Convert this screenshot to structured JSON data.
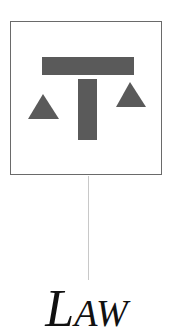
{
  "icon": {
    "name": "scales-of-justice",
    "color": "#5a5a5a",
    "frame_color": "#6a6a6a"
  },
  "connector": {
    "color": "#c8c8c8"
  },
  "label": {
    "text": "LAW",
    "first": "L",
    "rest": "AW"
  }
}
